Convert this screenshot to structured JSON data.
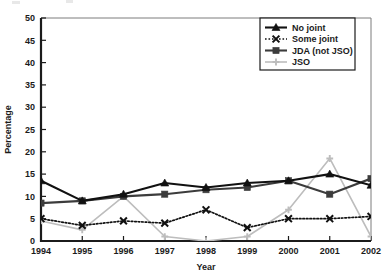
{
  "chart_data": {
    "type": "line",
    "title": "",
    "xlabel": "Year",
    "ylabel": "Percentage",
    "categories": [
      1994,
      1995,
      1996,
      1997,
      1998,
      1999,
      2000,
      2001,
      2002
    ],
    "x": [
      "1994",
      "1995",
      "1996",
      "1997",
      "1998",
      "1999",
      "2000",
      "2001",
      "2002"
    ],
    "xlim": [
      1994,
      2002
    ],
    "ylim": [
      0,
      50
    ],
    "yticks": [
      0,
      5,
      10,
      15,
      20,
      25,
      30,
      35,
      40,
      45,
      50
    ],
    "ytick_labels": [
      "0",
      "5",
      "10",
      "15",
      "20",
      "25",
      "30",
      "35",
      "40",
      "45",
      "50"
    ],
    "grid": false,
    "legend_position": "top-right",
    "series": [
      {
        "name": "No joint",
        "color": "#111111",
        "marker": "triangle",
        "linestyle": "solid",
        "values": [
          13.5,
          9.0,
          10.5,
          13.0,
          12.0,
          13.0,
          13.5,
          15.0,
          12.5
        ]
      },
      {
        "name": "Some joint",
        "color": "#111111",
        "marker": "x",
        "linestyle": "dotted",
        "values": [
          5.0,
          3.5,
          4.5,
          4.0,
          7.0,
          3.0,
          5.0,
          5.0,
          5.5
        ]
      },
      {
        "name": "JDA (not JSO)",
        "color": "#3c3c3c",
        "marker": "square",
        "linestyle": "solid",
        "values": [
          8.5,
          9.0,
          10.0,
          10.5,
          11.5,
          12.0,
          13.5,
          10.5,
          14.0
        ]
      },
      {
        "name": "JSO",
        "color": "#bdbdbd",
        "marker": "plus",
        "linestyle": "solid",
        "values": [
          4.5,
          2.5,
          10.0,
          1.0,
          0.0,
          1.0,
          7.0,
          18.5,
          1.0
        ]
      }
    ]
  }
}
